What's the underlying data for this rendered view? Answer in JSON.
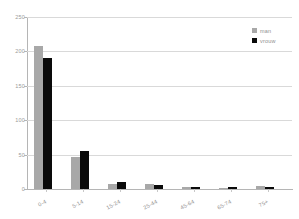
{
  "chart_data": {
    "type": "bar",
    "title": "",
    "subtitle": "",
    "xlabel": "",
    "ylabel": "",
    "categories": [
      "0-4",
      "5-14",
      "15-24",
      "25-44",
      "45-64",
      "65-74",
      "75+"
    ],
    "series": [
      {
        "name": "man",
        "color": "#a8a8a8",
        "values": [
          208,
          46,
          7,
          7,
          3,
          2,
          4
        ]
      },
      {
        "name": "vrouw",
        "color": "#0a0a0a",
        "values": [
          190,
          55,
          10,
          6,
          3,
          3,
          3
        ]
      }
    ],
    "ylim": [
      0,
      250
    ],
    "yticks": [
      0,
      50,
      100,
      150,
      200,
      250
    ],
    "ytick_labels": [
      "0",
      "50",
      "100",
      "150",
      "200",
      "250"
    ],
    "grid": true,
    "grid_axis": "y",
    "legend_position": "top-right",
    "background": "#ffffff",
    "axis_color": "#b5b5b5",
    "grid_color": "#d9d9d9",
    "tick_label_color": "#9a9a9a",
    "xtick_rotation": -27
  }
}
